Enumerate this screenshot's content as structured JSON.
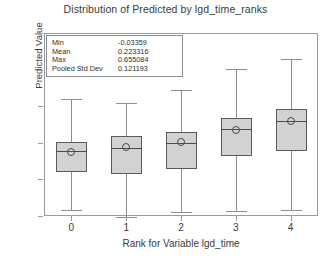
{
  "chart_data": {
    "type": "box",
    "title": "Distribution of Predicted by lgd_time_ranks",
    "xlabel": "Rank for Variable lgd_time",
    "ylabel": "Predicted Value",
    "categories": [
      "0",
      "1",
      "2",
      "3",
      "4"
    ],
    "ytick_labels": [
      "0.8",
      "0.6",
      "0.4",
      "0.2",
      "-0.2",
      "0.0"
    ],
    "ytick_values": [
      0.8,
      0.6,
      0.4,
      0.2,
      0.0,
      -0.2
    ],
    "ylim": [
      -0.2,
      0.8
    ],
    "grid": false,
    "legend": "none",
    "boxes": [
      {
        "category": "0",
        "whisker_low": -0.165,
        "q1": 0.04,
        "median": 0.155,
        "q3": 0.205,
        "whisker_high": 0.44,
        "mean": 0.148
      },
      {
        "category": "1",
        "whisker_low": -0.205,
        "q1": 0.028,
        "median": 0.172,
        "q3": 0.238,
        "whisker_high": 0.42,
        "mean": 0.175
      },
      {
        "category": "2",
        "whisker_low": -0.18,
        "q1": 0.055,
        "median": 0.198,
        "q3": 0.258,
        "whisker_high": 0.49,
        "mean": 0.205
      },
      {
        "category": "3",
        "whisker_low": -0.175,
        "q1": 0.128,
        "median": 0.275,
        "q3": 0.333,
        "whisker_high": 0.605,
        "mean": 0.272
      },
      {
        "category": "4",
        "whisker_low": -0.168,
        "q1": 0.155,
        "median": 0.32,
        "q3": 0.385,
        "whisker_high": 0.66,
        "mean": 0.318
      }
    ],
    "stats": [
      {
        "label": "Min",
        "value": "-0.03359"
      },
      {
        "label": "Mean",
        "value": "0.223316"
      },
      {
        "label": "Max",
        "value": "0.655084"
      },
      {
        "label": "Pooled Std Dev",
        "value": "0.121193"
      }
    ],
    "colors": {
      "box_fill": "#d2d2d2",
      "box_border": "#5a5a5a",
      "whisker": "#8e8e8e",
      "axis": "#9a9a9a",
      "text": "#3a3a3a"
    }
  }
}
